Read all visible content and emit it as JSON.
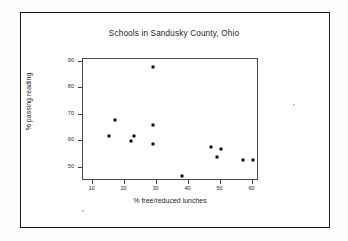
{
  "chart_data": {
    "type": "scatter",
    "title": "Schools in Sandusky County, Ohio",
    "xlabel": "% free/reduced lunches",
    "ylabel": "% passing reading",
    "xlim": [
      7,
      62
    ],
    "ylim": [
      45,
      91
    ],
    "xticks": [
      10,
      20,
      30,
      40,
      50,
      60
    ],
    "yticks": [
      50,
      60,
      70,
      80,
      90
    ],
    "xtick_labels": [
      "10",
      "20",
      "30",
      "40",
      "50",
      "60"
    ],
    "ytick_labels": [
      "50",
      "60",
      "70",
      "80",
      "90"
    ],
    "grid": false,
    "legend": null,
    "marker": "filled-square",
    "marker_color": "#0d0d0d",
    "points": [
      {
        "x": 15,
        "y": 62
      },
      {
        "x": 17,
        "y": 68
      },
      {
        "x": 22,
        "y": 60
      },
      {
        "x": 23,
        "y": 62
      },
      {
        "x": 29,
        "y": 88
      },
      {
        "x": 29,
        "y": 66
      },
      {
        "x": 29,
        "y": 59
      },
      {
        "x": 38,
        "y": 47
      },
      {
        "x": 47,
        "y": 58
      },
      {
        "x": 49,
        "y": 54
      },
      {
        "x": 50,
        "y": 57
      },
      {
        "x": 57,
        "y": 53
      },
      {
        "x": 60,
        "y": 53
      }
    ]
  },
  "figure": {
    "frame_color": "#1c1c1c",
    "background": "#ffffff",
    "axis_color": "#4a4a4a"
  }
}
